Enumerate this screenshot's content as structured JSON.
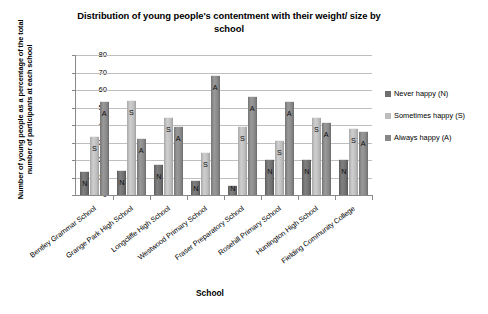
{
  "chart_data": {
    "type": "bar",
    "title": "Distribution of young people's contentment with their weight/ size by school",
    "xlabel": "School",
    "ylabel": "Number of young people as a percentage of the total number of participants at each school",
    "ylim": [
      0,
      80
    ],
    "yticks": [
      80,
      70,
      60,
      50,
      40,
      30,
      20,
      10,
      0
    ],
    "grid": true,
    "legend_position": "right",
    "categories": [
      "Bentley Grammar School",
      "Grange Park High School",
      "Longcliffe High School",
      "Westwood Primary School",
      "Fraser Preparatory School",
      "Rosehill Primary School",
      "Huntington High School",
      "Fielding Community College"
    ],
    "series": [
      {
        "name": "Never happy (N)",
        "marker": "N",
        "color": "#6f6f6f",
        "values": [
          13,
          14,
          17,
          8,
          5,
          20,
          20,
          20
        ]
      },
      {
        "name": "Sometimes happy (S)",
        "marker": "S",
        "color": "#bdbdbd",
        "values": [
          33,
          54,
          44,
          24,
          39,
          31,
          44,
          38
        ]
      },
      {
        "name": "Always happy (A)",
        "marker": "A",
        "color": "#888888",
        "values": [
          53,
          32,
          39,
          68,
          56,
          53,
          41,
          36
        ]
      }
    ]
  }
}
